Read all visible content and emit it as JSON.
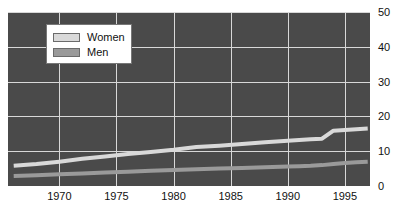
{
  "chart_data": {
    "type": "line",
    "title": "",
    "xlabel": "",
    "ylabel": "",
    "xlim": [
      1965.5,
      1997.2
    ],
    "ylim": [
      0,
      50
    ],
    "grid": true,
    "legend_position": "top-left",
    "xticks": [
      1970,
      1975,
      1980,
      1985,
      1990,
      1995
    ],
    "yticks": [
      0,
      10,
      20,
      30,
      40,
      50
    ],
    "x": [
      1966,
      1968,
      1970,
      1972,
      1974,
      1976,
      1978,
      1980,
      1982,
      1984,
      1986,
      1988,
      1990,
      1991,
      1992,
      1993,
      1994,
      1995,
      1996,
      1997
    ],
    "series": [
      {
        "name": "Women",
        "color": "#d9d9d9",
        "values": [
          5.8,
          6.3,
          7.0,
          7.8,
          8.5,
          9.2,
          9.8,
          10.4,
          11.2,
          11.6,
          12.1,
          12.6,
          13.0,
          13.2,
          13.4,
          13.6,
          15.9,
          16.1,
          16.3,
          16.5
        ]
      },
      {
        "name": "Men",
        "color": "#9a9a9a",
        "values": [
          2.9,
          3.1,
          3.4,
          3.6,
          3.9,
          4.1,
          4.4,
          4.6,
          4.8,
          5.0,
          5.2,
          5.4,
          5.6,
          5.7,
          5.8,
          6.0,
          6.3,
          6.6,
          6.8,
          7.0
        ]
      }
    ]
  },
  "legend": {
    "items": [
      {
        "label": "Women",
        "swatch_color": "#d9d9d9"
      },
      {
        "label": "Men",
        "swatch_color": "#9a9a9a"
      }
    ]
  },
  "style": {
    "plot_background": "#4a4a4a",
    "gridline_color": "#d8d8d8",
    "tick_label_color": "#111111",
    "page_background": "#ffffff"
  }
}
